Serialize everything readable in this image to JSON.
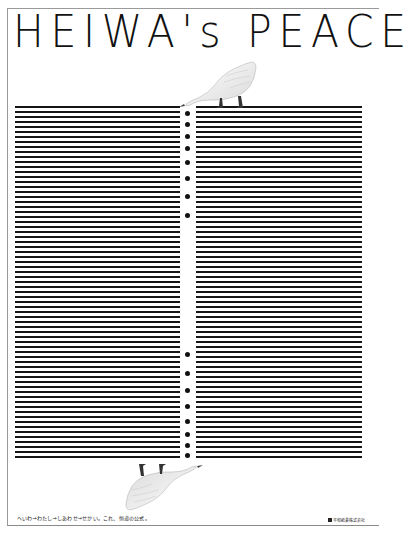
{
  "poster": {
    "title": "HEIWA's PEACE",
    "tagline": "へいわ→わたし→しあわせ→せかい。これ、恒道の公式。",
    "company": "平和紙業株式会社",
    "colors": {
      "background": "#ffffff",
      "lines": "#151515",
      "dots": "#111111",
      "border": "#9a9a9a"
    },
    "stripes": {
      "count": 71,
      "top_y": 106,
      "pitch": 5.0,
      "thickness": 2.4
    },
    "dots_top_y": [
      113,
      124,
      136,
      148,
      162,
      178,
      196,
      215
    ],
    "dots_bottom_y": [
      354,
      373,
      390,
      406,
      421,
      434,
      445,
      455
    ],
    "illustrations": [
      {
        "name": "duck-top",
        "description": "white duck standing on top of right stripe block, head down toward gap"
      },
      {
        "name": "duck-bottom",
        "description": "white duck upside-down hanging below left stripe block"
      }
    ]
  }
}
